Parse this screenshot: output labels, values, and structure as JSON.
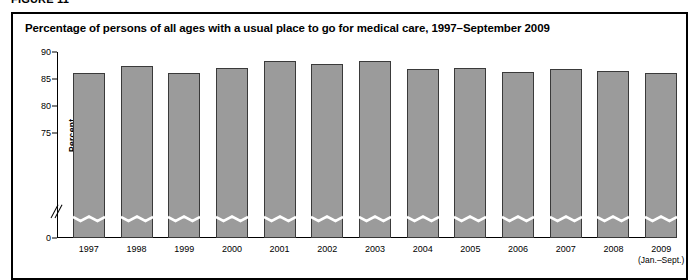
{
  "figure": {
    "number_label": "FIGURE 11",
    "title": "Percentage of persons of all ages with a usual place to go for medical care, 1997–September 2009"
  },
  "chart_data": {
    "type": "bar",
    "title": "Percentage of persons of all ages with a usual place to go for medical care, 1997–September 2009",
    "xlabel": "",
    "ylabel": "Percent",
    "categories": [
      "1997",
      "1998",
      "1999",
      "2000",
      "2001",
      "2002",
      "2003",
      "2004",
      "2005",
      "2006",
      "2007",
      "2008",
      "2009"
    ],
    "category_sublabels": [
      "",
      "",
      "",
      "",
      "",
      "",
      "",
      "",
      "",
      "",
      "",
      "",
      "(Jan.–Sept.)"
    ],
    "values": [
      86.2,
      87.4,
      86.2,
      87.0,
      88.3,
      87.8,
      88.3,
      86.9,
      87.0,
      86.3,
      86.8,
      86.5,
      86.2
    ],
    "ylim": [
      0,
      90
    ],
    "yticks": [
      90,
      85,
      80,
      75,
      0
    ],
    "ytick_labels": [
      "90",
      "85",
      "80",
      "75",
      "0"
    ],
    "axis_break": true,
    "axis_break_note": "y-axis broken between 75 and 0; each bar carries a wavy break mark",
    "grid": false,
    "legend": false,
    "bar_color": "#9b9b9b",
    "bar_border_color": "#3a3a3a"
  }
}
